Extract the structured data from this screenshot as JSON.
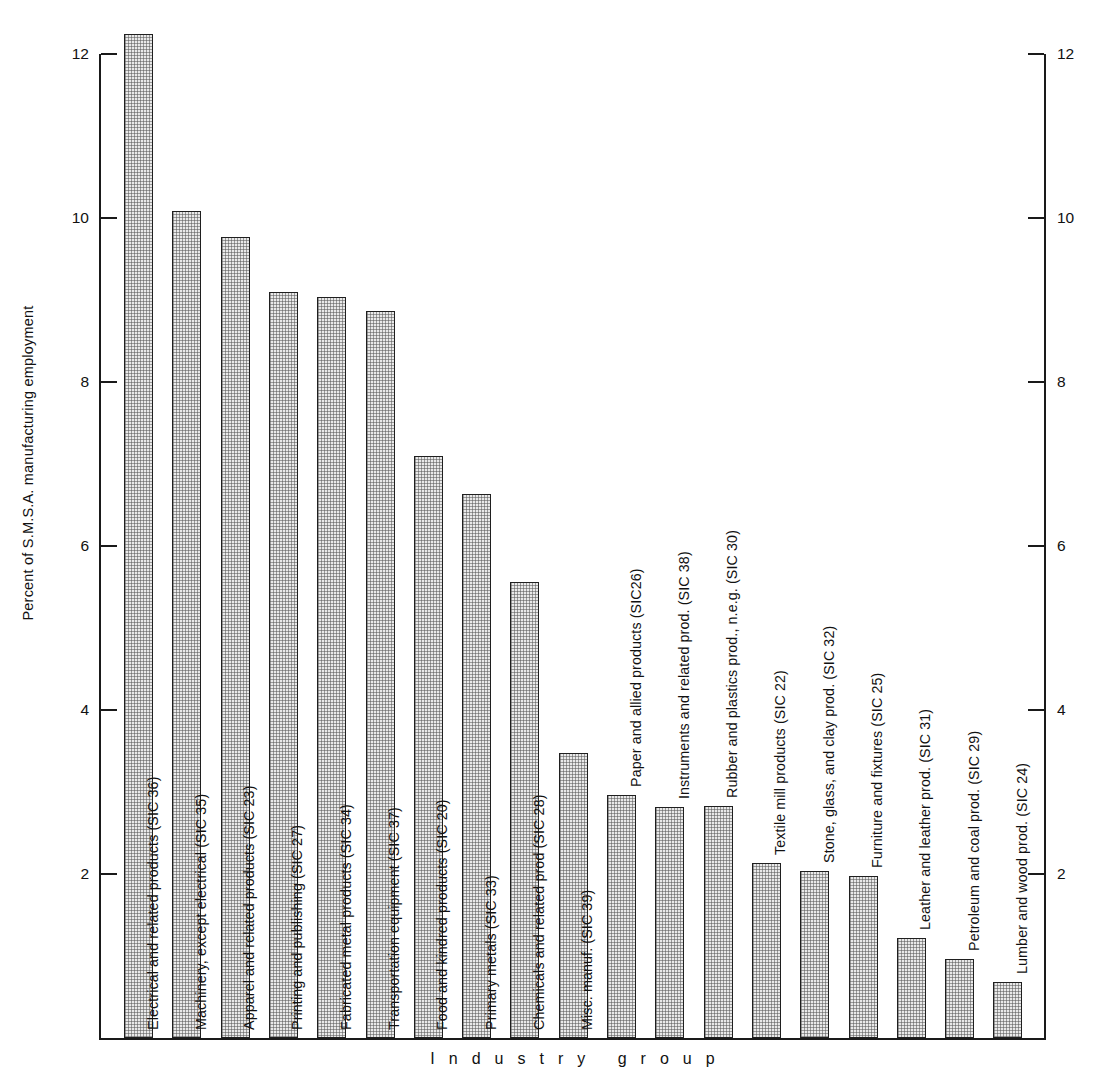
{
  "chart_data": {
    "type": "bar",
    "title": "",
    "xlabel": "Industry group",
    "ylabel": "Percent of S.M.S.A. manufacturing employment",
    "ylim": [
      0,
      12.8
    ],
    "yticks": [
      2,
      4,
      6,
      8,
      10,
      12
    ],
    "ytick_labels": [
      "2",
      "4",
      "6",
      "8",
      "10",
      "12"
    ],
    "grid": false,
    "legend": null,
    "dual_axis": true,
    "right_axis_ticks": [
      "2",
      "4",
      "6",
      "8",
      "10",
      "12"
    ],
    "categories": [
      "Electrical and related products (SIC 36)",
      "Machinery, except electrical (SIC 35)",
      "Apparel and related products (SIC 23)",
      "Printing and publishing (SIC 27)",
      "Fabricated metal products (SIC 34)",
      "Transportation equipment (SIC 37)",
      "Food and kindred products (SIC 20)",
      "Primary metals (SIC 33)",
      "Chemicals and related prod (SIC 28)",
      "Misc. manuf. (SIC 39)",
      "Paper and allied products (SIC26)",
      "Instruments and related prod. (SIC 38)",
      "Rubber and plastics prod., n.e.g. (SIC 30)",
      "Textile mill products (SIC 22)",
      "Stone, glass, and clay prod. (SIC 32)",
      "Furniture and fixtures (SIC 25)",
      "Leather and leather prod. (SIC 31)",
      "Petroleum and coal prod. (SIC 29)",
      "Lumber and wood prod. (SIC 24)"
    ],
    "values": [
      12.25,
      10.08,
      9.77,
      9.1,
      9.04,
      8.87,
      7.1,
      6.63,
      5.56,
      3.48,
      2.96,
      2.82,
      2.83,
      2.14,
      2.04,
      1.98,
      1.22,
      0.96,
      0.68
    ]
  },
  "bar_labels": [
    "Electrical and related products (SIC 36)",
    "Machinery, except electrical (SIC 35)",
    "Apparel and related products (SIC 23)",
    "Printing and publishing (SIC 27)",
    "Fabricated metal products (SIC 34)",
    "Transportation equipment (SIC 37)",
    "Food and kindred products (SIC 20)",
    "Primary metals (SIC 33)",
    "Chemicals and related prod (SIC 28)",
    "Misc. manuf. (SIC 39)",
    "Paper and allied products (SIC26)",
    "Instruments and related prod. (SIC 38)",
    "Rubber and plastics prod., n.e.g. (SIC 30)",
    "Textile mill products (SIC 22)",
    "Stone, glass, and clay prod. (SIC 32)",
    "Furniture and fixtures (SIC 25)",
    "Leather and leather prod. (SIC 31)",
    "Petroleum and coal prod. (SIC 29)",
    "Lumber and wood prod. (SIC 24)"
  ],
  "axes": {
    "y_title": "Percent of S.M.S.A. manufacturing employment",
    "x_title": "Industry group",
    "ticks": [
      "12",
      "10",
      "8",
      "6",
      "4",
      "2"
    ]
  },
  "style": {
    "bar_fill": "#e9e9e9",
    "bar_stroke": "#1f1f1f",
    "axis_color": "#1a1a1a",
    "text_color": "#111111",
    "background": "#ffffff"
  }
}
